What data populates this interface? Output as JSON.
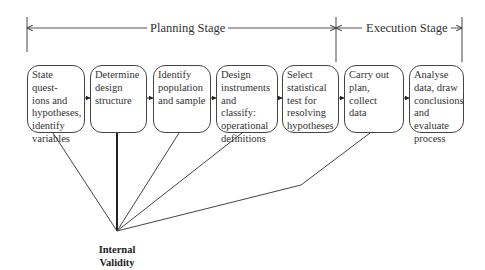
{
  "stages": {
    "planning": "Planning Stage",
    "execution": "Execution Stage"
  },
  "steps": [
    {
      "label": "State quest-\nions and\nhypotheses,\nidentify\nvariables"
    },
    {
      "label": "Determine\ndesign\nstructure"
    },
    {
      "label": "Identify\npopulation\nand sample"
    },
    {
      "label": "Design\ninstruments\nand classify:\noperational\ndefinitions"
    },
    {
      "label": "Select\nstatistical\ntest for\nresolving\nhypotheses"
    },
    {
      "label": "Carry out\nplan,\ncollect\ndata"
    },
    {
      "label": "Analyse\ndata, draw\nconclusions\nand evaluate\nprocess"
    }
  ],
  "outcome": {
    "line1": "Internal",
    "line2": "Validity"
  }
}
